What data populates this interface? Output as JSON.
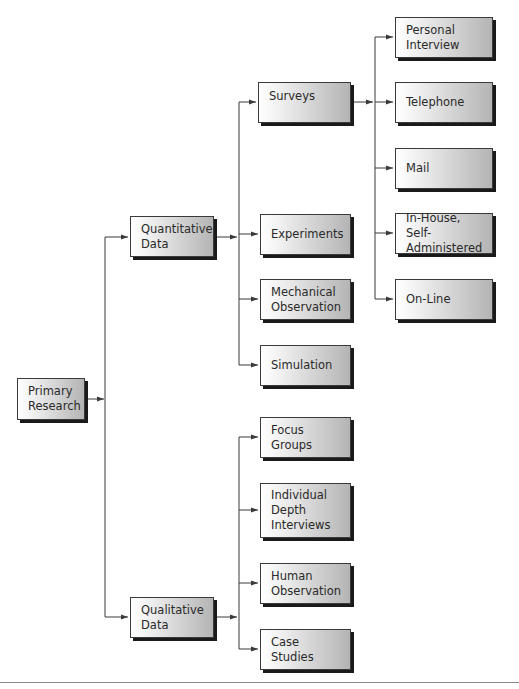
{
  "diagram": {
    "type": "tree",
    "root": "Primary Research",
    "nodes": {
      "primary_research": {
        "label": "Primary\nResearch"
      },
      "quantitative": {
        "label": "Quantitative\nData"
      },
      "qualitative": {
        "label": "Qualitative\nData"
      },
      "surveys": {
        "label": "Surveys"
      },
      "experiments": {
        "label": "Experiments"
      },
      "mechanical_observation": {
        "label": "Mechanical\nObservation"
      },
      "simulation": {
        "label": "Simulation"
      },
      "personal_interview": {
        "label": "Personal\nInterview"
      },
      "telephone": {
        "label": "Telephone"
      },
      "mail": {
        "label": "Mail"
      },
      "in_house": {
        "label": "In-House, Self-\nAdministered"
      },
      "on_line": {
        "label": "On-Line"
      },
      "focus_groups": {
        "label": "Focus Groups"
      },
      "depth_interviews": {
        "label": "Individual\nDepth\nInterviews"
      },
      "human_observation": {
        "label": "Human\nObservation"
      },
      "case_studies": {
        "label": "Case Studies"
      }
    },
    "edges": [
      [
        "Primary Research",
        "Quantitative Data"
      ],
      [
        "Primary Research",
        "Qualitative Data"
      ],
      [
        "Quantitative Data",
        "Surveys"
      ],
      [
        "Quantitative Data",
        "Experiments"
      ],
      [
        "Quantitative Data",
        "Mechanical Observation"
      ],
      [
        "Quantitative Data",
        "Simulation"
      ],
      [
        "Surveys",
        "Personal Interview"
      ],
      [
        "Surveys",
        "Telephone"
      ],
      [
        "Surveys",
        "Mail"
      ],
      [
        "Surveys",
        "In-House, Self-Administered"
      ],
      [
        "Surveys",
        "On-Line"
      ],
      [
        "Qualitative Data",
        "Focus Groups"
      ],
      [
        "Qualitative Data",
        "Individual Depth Interviews"
      ],
      [
        "Qualitative Data",
        "Human Observation"
      ],
      [
        "Qualitative Data",
        "Case Studies"
      ]
    ],
    "colors": {
      "line": "#3a3a3a",
      "box_border": "#3a3a3a",
      "shadow": "#1a1a1a",
      "gradient_start": "#ffffff",
      "gradient_end": "#b4b4b4",
      "text": "#2a2a2a"
    }
  }
}
